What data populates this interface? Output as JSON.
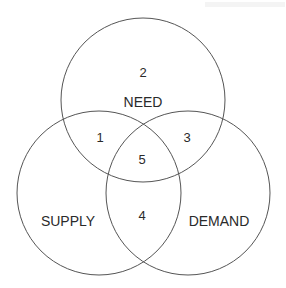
{
  "diagram": {
    "type": "venn",
    "stroke_color": "#555555",
    "circles": [
      {
        "name": "need",
        "label": "NEED",
        "cx": 143,
        "cy": 100,
        "r": 82
      },
      {
        "name": "supply",
        "label": "SUPPLY",
        "cx": 99,
        "cy": 193,
        "r": 82
      },
      {
        "name": "demand",
        "label": "DEMAND",
        "cx": 188,
        "cy": 193,
        "r": 82
      }
    ],
    "regions": {
      "r1": "1",
      "r2": "2",
      "r3": "3",
      "r4": "4",
      "r5": "5"
    },
    "labels": {
      "need": "NEED",
      "supply": "SUPPLY",
      "demand": "DEMAND"
    }
  }
}
